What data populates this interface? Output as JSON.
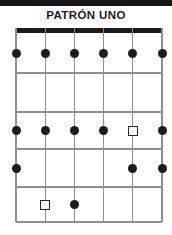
{
  "title": "PATRÓN UNO",
  "colors": {
    "top_bar": "#161616",
    "title_text": "#1c1c1c",
    "nut": "#1a1a1a",
    "grid_line": "#8f8f8f",
    "dot": "#1c1c1c",
    "square_border": "#2a2a2a",
    "background": "#ffffff"
  },
  "diagram": {
    "type": "fretboard-grid",
    "strings": 6,
    "fret_spaces": 5,
    "marker_types": {
      "dot": "filled note dot",
      "square": "open root square"
    },
    "markers": [
      {
        "string": 1,
        "fret": 1,
        "type": "dot"
      },
      {
        "string": 2,
        "fret": 1,
        "type": "dot"
      },
      {
        "string": 3,
        "fret": 1,
        "type": "dot"
      },
      {
        "string": 4,
        "fret": 1,
        "type": "dot"
      },
      {
        "string": 5,
        "fret": 1,
        "type": "dot"
      },
      {
        "string": 6,
        "fret": 1,
        "type": "dot"
      },
      {
        "string": 1,
        "fret": 3,
        "type": "dot"
      },
      {
        "string": 2,
        "fret": 3,
        "type": "dot"
      },
      {
        "string": 3,
        "fret": 3,
        "type": "dot"
      },
      {
        "string": 4,
        "fret": 3,
        "type": "dot"
      },
      {
        "string": 5,
        "fret": 3,
        "type": "square"
      },
      {
        "string": 6,
        "fret": 3,
        "type": "dot"
      },
      {
        "string": 1,
        "fret": 4,
        "type": "dot"
      },
      {
        "string": 5,
        "fret": 4,
        "type": "dot"
      },
      {
        "string": 6,
        "fret": 4,
        "type": "dot"
      },
      {
        "string": 2,
        "fret": 5,
        "type": "square"
      },
      {
        "string": 3,
        "fret": 5,
        "type": "dot"
      }
    ]
  }
}
